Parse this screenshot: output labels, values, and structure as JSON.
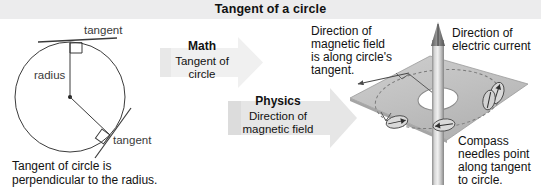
{
  "header": {
    "title": "Tangent of a circle",
    "background": "#ececed"
  },
  "math_panel": {
    "name": "tangent-of-circle-diagram",
    "labels": {
      "radius": "radius",
      "tangent_top": "tangent",
      "tangent_lower": "tangent"
    },
    "caption_line1": "Tangent of circle is",
    "caption_line2": "perpendicular to the radius."
  },
  "arrows": [
    {
      "id": "math-arrow",
      "heading": "Math",
      "line1": "Tangent of",
      "line2": "circle",
      "fill": "#efefef"
    },
    {
      "id": "physics-arrow",
      "heading": "Physics",
      "line1": "Direction of",
      "line2": "magnetic field",
      "fill": "#e4e4e4"
    }
  ],
  "physics_panel": {
    "name": "magnetic-field-diagram",
    "magnetic_field_note": {
      "line1": "Direction of",
      "line2": "magnetic field",
      "line3": "is along circle's",
      "line4": "tangent."
    },
    "current_note": {
      "line1": "Direction of",
      "line2": "electric current"
    },
    "compass_note": {
      "line1": "Compass",
      "line2": "needles point",
      "line3": "along tangent",
      "line4": "to circle."
    },
    "plate_color": "#c2c2c2",
    "wire_color": "#b4b4b4",
    "compass_needle_count": 4
  }
}
